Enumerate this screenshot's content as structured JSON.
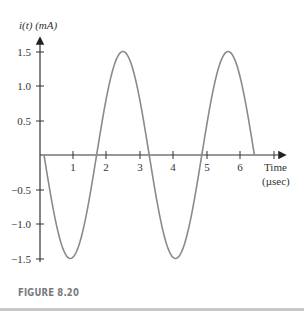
{
  "figure": {
    "caption": "FIGURE 8.20"
  },
  "chart_data": {
    "type": "line",
    "title": "",
    "ylabel": "i(t)  (mA)",
    "xlabel": "Time (µsec)",
    "xlabel_line1": "Time",
    "xlabel_line2": "(µsec)",
    "xlim": [
      0,
      7
    ],
    "ylim": [
      -1.5,
      1.5
    ],
    "x_ticks": [
      1,
      2,
      3,
      4,
      5,
      6,
      7
    ],
    "x_tick_labels": [
      "1",
      "2",
      "3",
      "4",
      "5",
      "6"
    ],
    "y_ticks": [
      1.5,
      1.0,
      0.5,
      -0.5,
      -1.0,
      -1.5
    ],
    "y_tick_labels": [
      "1.5",
      "1.0",
      "0.5",
      "−0.5",
      "−1.0",
      "−1.5"
    ],
    "grid": false,
    "series": [
      {
        "name": "i(t)",
        "description": "sinusoid, amplitude 1.5 mA, period ≈ 3.14 µs, starts at ~0.12 µs going negative",
        "amplitude": 1.5,
        "period": 3.14,
        "t_start": 0.12,
        "t_end": 6.4,
        "x": [
          0.12,
          0.9,
          1.7,
          2.5,
          3.3,
          4.0,
          4.9,
          5.7,
          6.4
        ],
        "values": [
          0,
          -1.5,
          0,
          1.5,
          0,
          -1.5,
          0,
          1.5,
          0.12
        ]
      }
    ],
    "colors": {
      "curve": "#8a8a8a",
      "axis": "#333333"
    }
  }
}
